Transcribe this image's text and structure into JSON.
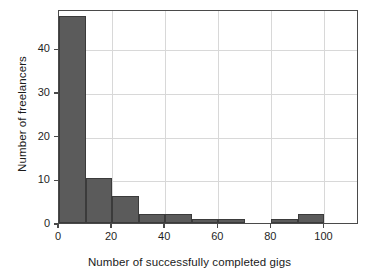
{
  "chart_data": {
    "type": "bar",
    "title": "",
    "xlabel": "Number of successfully completed gigs",
    "ylabel": "Number of freelancers",
    "xlim": [
      0,
      113
    ],
    "ylim": [
      0,
      49
    ],
    "grid": true,
    "legend": null,
    "bin_width": 10,
    "bar_color": "#5b5b5b",
    "bar_edge_color": "#3b3b3b",
    "categories": [
      "0-10",
      "10-20",
      "20-30",
      "30-40",
      "40-50",
      "50-60",
      "60-70",
      "70-80",
      "80-90",
      "90-100",
      "100-110"
    ],
    "bin_starts": [
      0,
      10,
      20,
      30,
      40,
      50,
      60,
      70,
      80,
      90,
      100
    ],
    "values": [
      47.5,
      10.3,
      6.3,
      2,
      2,
      1,
      1,
      0,
      1,
      2,
      0
    ],
    "xticks": [
      0,
      20,
      40,
      60,
      80,
      100
    ],
    "xtick_labels": [
      "0",
      "20",
      "40",
      "60",
      "80",
      "100"
    ],
    "yticks": [
      0,
      10,
      20,
      30,
      40
    ],
    "ytick_labels": [
      "0",
      "10",
      "20",
      "30",
      "40"
    ]
  }
}
